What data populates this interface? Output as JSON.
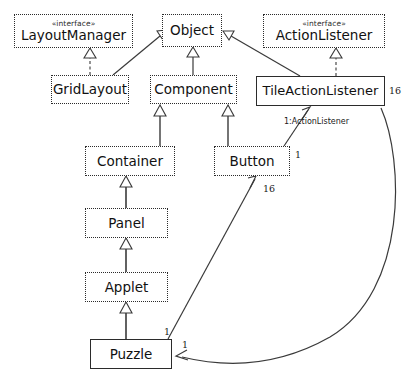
{
  "diagram": {
    "type": "uml-class-diagram",
    "background_color": "#ffffff",
    "line_color": "#3a3a3a",
    "nodes": [
      {
        "id": "layoutmanager",
        "name": "LayoutManager",
        "stereotype": "«interface»",
        "kind": "interface",
        "border": "dotted",
        "x": 14,
        "y": 14,
        "w": 119,
        "h": 34
      },
      {
        "id": "object",
        "name": "Object",
        "stereotype": "",
        "kind": "class",
        "border": "dotted",
        "x": 162,
        "y": 14,
        "w": 60,
        "h": 33
      },
      {
        "id": "actionlistener",
        "name": "ActionListener",
        "stereotype": "«interface»",
        "kind": "interface",
        "border": "dotted",
        "x": 263,
        "y": 14,
        "w": 122,
        "h": 34
      },
      {
        "id": "gridlayout",
        "name": "GridLayout",
        "stereotype": "",
        "kind": "class",
        "border": "dotted",
        "x": 51,
        "y": 75,
        "w": 78,
        "h": 29
      },
      {
        "id": "component",
        "name": "Component",
        "stereotype": "",
        "kind": "class",
        "border": "dotted",
        "x": 150,
        "y": 75,
        "w": 87,
        "h": 29
      },
      {
        "id": "tileactionlistener",
        "name": "TileActionListener",
        "stereotype": "",
        "kind": "class",
        "border": "solid",
        "x": 256,
        "y": 76,
        "w": 129,
        "h": 30
      },
      {
        "id": "container",
        "name": "Container",
        "stereotype": "",
        "kind": "class",
        "border": "dotted",
        "x": 85,
        "y": 146,
        "w": 90,
        "h": 30
      },
      {
        "id": "button",
        "name": "Button",
        "stereotype": "",
        "kind": "class",
        "border": "dotted",
        "x": 214,
        "y": 146,
        "w": 76,
        "h": 30
      },
      {
        "id": "panel",
        "name": "Panel",
        "stereotype": "",
        "kind": "class",
        "border": "dotted",
        "x": 85,
        "y": 208,
        "w": 83,
        "h": 30
      },
      {
        "id": "applet",
        "name": "Applet",
        "stereotype": "",
        "kind": "class",
        "border": "dotted",
        "x": 85,
        "y": 272,
        "w": 83,
        "h": 30
      },
      {
        "id": "puzzle",
        "name": "Puzzle",
        "stereotype": "",
        "kind": "class",
        "border": "solid",
        "x": 90,
        "y": 339,
        "w": 82,
        "h": 30
      }
    ],
    "edges": [
      {
        "id": "gridlayout-layoutmanager",
        "from": "gridlayout",
        "to": "layoutmanager",
        "type": "realization",
        "style": "dashed",
        "arrow": "hollow-triangle",
        "label": ""
      },
      {
        "id": "gridlayout-object",
        "from": "gridlayout",
        "to": "object",
        "type": "generalization",
        "style": "solid",
        "arrow": "hollow-triangle",
        "label": ""
      },
      {
        "id": "component-object",
        "from": "component",
        "to": "object",
        "type": "generalization",
        "style": "solid",
        "arrow": "hollow-triangle",
        "label": ""
      },
      {
        "id": "tileactionlistener-object",
        "from": "tileactionlistener",
        "to": "object",
        "type": "generalization",
        "style": "solid",
        "arrow": "hollow-triangle",
        "label": ""
      },
      {
        "id": "tileactionlistener-actionlistener",
        "from": "tileactionlistener",
        "to": "actionlistener",
        "type": "realization",
        "style": "dashed",
        "arrow": "hollow-triangle",
        "label": ""
      },
      {
        "id": "container-component",
        "from": "container",
        "to": "component",
        "type": "generalization",
        "style": "solid",
        "arrow": "hollow-triangle",
        "label": ""
      },
      {
        "id": "button-component",
        "from": "button",
        "to": "component",
        "type": "generalization",
        "style": "solid",
        "arrow": "hollow-triangle",
        "label": ""
      },
      {
        "id": "panel-container",
        "from": "panel",
        "to": "container",
        "type": "generalization",
        "style": "solid",
        "arrow": "hollow-triangle",
        "label": ""
      },
      {
        "id": "applet-panel",
        "from": "applet",
        "to": "panel",
        "type": "generalization",
        "style": "solid",
        "arrow": "hollow-triangle",
        "label": ""
      },
      {
        "id": "puzzle-applet",
        "from": "puzzle",
        "to": "applet",
        "type": "generalization",
        "style": "solid",
        "arrow": "hollow-triangle",
        "label": ""
      },
      {
        "id": "puzzle-button",
        "from": "puzzle",
        "to": "button",
        "type": "association",
        "style": "solid",
        "arrow": "open",
        "label": "",
        "source_multiplicity": "1",
        "target_multiplicity": "16"
      },
      {
        "id": "button-tileactionlistener",
        "from": "button",
        "to": "tileactionlistener",
        "type": "association",
        "style": "solid",
        "arrow": "open",
        "label": "1:ActionListener",
        "source_multiplicity": "1",
        "target_multiplicity": ""
      },
      {
        "id": "tileactionlistener-puzzle",
        "from": "tileactionlistener",
        "to": "puzzle",
        "type": "association",
        "style": "solid",
        "arrow": "open",
        "label": "",
        "source_multiplicity": "16",
        "target_multiplicity": "1"
      }
    ],
    "multiplicity_labels": [
      {
        "id": "mult-16-tile-right",
        "text": "16",
        "x": 389,
        "y": 85
      },
      {
        "id": "mult-16-button",
        "text": "16",
        "x": 263,
        "y": 183
      },
      {
        "id": "mult-1-button",
        "text": "1",
        "x": 295,
        "y": 149
      },
      {
        "id": "mult-1-puzzle-top",
        "text": "1",
        "x": 164,
        "y": 327
      },
      {
        "id": "mult-1-puzzle-right",
        "text": "1",
        "x": 182,
        "y": 340
      }
    ],
    "association_labels": [
      {
        "id": "label-actionlistener-role",
        "text": "1:ActionListener",
        "x": 284,
        "y": 118
      }
    ]
  }
}
